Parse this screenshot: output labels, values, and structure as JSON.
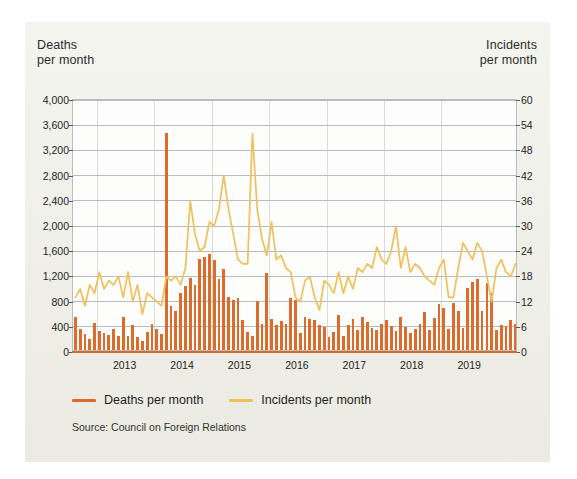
{
  "card": {
    "background_color": "#efefe7"
  },
  "axes": {
    "left_caption_line1": "Deaths",
    "left_caption_line2": "per month",
    "right_caption_line1": "Incidents",
    "right_caption_line2": "per month"
  },
  "legend": {
    "deaths_label": "Deaths per month",
    "incidents_label": "Incidents per month",
    "deaths_color": "#dd6b2c",
    "incidents_color": "#f0c05a"
  },
  "source": "Source: Council on Foreign Relations",
  "chart_data": {
    "type": "bar",
    "title": "",
    "subtitle": "",
    "xlabel": "",
    "ylabel": "Deaths per month",
    "y2label": "Incidents per month",
    "ylim": [
      0,
      4000
    ],
    "ytick_step": 400,
    "yticks": [
      0,
      400,
      800,
      1200,
      1600,
      2000,
      2400,
      2800,
      3200,
      3600,
      4000
    ],
    "ytick_labels": [
      "0",
      "400",
      "800",
      "1,200",
      "1,600",
      "2,000",
      "2,400",
      "2,800",
      "3,200",
      "3,600",
      "4,000"
    ],
    "y2lim": [
      0,
      60
    ],
    "y2tick_step": 6,
    "y2ticks": [
      0,
      6,
      12,
      18,
      24,
      30,
      36,
      42,
      48,
      54,
      60
    ],
    "y2tick_labels": [
      "0",
      "6",
      "12",
      "18",
      "24",
      "30",
      "36",
      "42",
      "48",
      "54",
      "60"
    ],
    "xtick_labels": [
      "2013",
      "2014",
      "2015",
      "2016",
      "2017",
      "2018",
      "2019"
    ],
    "x_start": "2012-08",
    "x_end": "2019-08",
    "grid": true,
    "legend_position": "below",
    "series": [
      {
        "name": "Deaths per month",
        "type": "bar",
        "axis": "left",
        "color": "#dd6b2c",
        "values": [
          520,
          330,
          250,
          180,
          430,
          300,
          270,
          240,
          330,
          230,
          520,
          230,
          400,
          200,
          140,
          290,
          420,
          330,
          250,
          3450,
          700,
          620,
          900,
          1010,
          1150,
          1030,
          1450,
          1480,
          1520,
          1430,
          1130,
          1280,
          840,
          790,
          830,
          480,
          280,
          230,
          780,
          420,
          1230,
          490,
          390,
          460,
          420,
          830,
          800,
          270,
          530,
          500,
          480,
          400,
          360,
          200,
          290,
          560,
          230,
          400,
          500,
          320,
          520,
          440,
          350,
          310,
          410,
          470,
          380,
          300,
          520,
          360,
          270,
          330,
          420,
          600,
          320,
          510,
          730,
          660,
          330,
          740,
          620,
          350,
          980,
          1080,
          1120,
          620,
          1060,
          900,
          320,
          400,
          380,
          470,
          420
        ]
      },
      {
        "name": "Incidents per month",
        "type": "line",
        "axis": "right",
        "color": "#f0c05a",
        "values": [
          13,
          15,
          11,
          16,
          14,
          19,
          15,
          17,
          16,
          18,
          13,
          19,
          12,
          16,
          9,
          14,
          13,
          12,
          11,
          18,
          17,
          18,
          16,
          20,
          36,
          28,
          24,
          25,
          31,
          30,
          34,
          42,
          34,
          28,
          22,
          21,
          21,
          52,
          34,
          27,
          23,
          31,
          22,
          23,
          20,
          19,
          13,
          12,
          17,
          18,
          13,
          10,
          17,
          16,
          14,
          19,
          14,
          18,
          15,
          20,
          19,
          21,
          20,
          25,
          22,
          21,
          24,
          30,
          20,
          25,
          19,
          21,
          20,
          18,
          17,
          16,
          20,
          22,
          13,
          13,
          20,
          26,
          24,
          22,
          26,
          24,
          18,
          12,
          20,
          22,
          19,
          18,
          21
        ]
      }
    ]
  }
}
